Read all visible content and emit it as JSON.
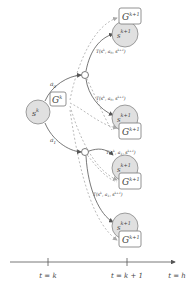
{
  "diagram": {
    "root": {
      "state_label": "s",
      "state_sup": "k",
      "value_label": "G",
      "value_sup": "k"
    },
    "actions": [
      {
        "label": "a",
        "sub": "0"
      },
      {
        "label": "a",
        "sub": "1"
      }
    ],
    "transitions": [
      {
        "label": "T(s^k, a_0, s_1^{k+1})",
        "text": "T(s",
        "sup": "k",
        "mid": ", a",
        "asub": "0",
        "end": ", s",
        "ssub": "1",
        "ssup": "k+1",
        "close": ")"
      },
      {
        "label": "T(s^k, a_0, s_2^{k+1})",
        "text": "T(s",
        "sup": "k",
        "mid": ", a",
        "asub": "0",
        "end": ", s",
        "ssub": "2",
        "ssup": "k+1",
        "close": ")"
      },
      {
        "label": "T(s^k, a_1, s_3^{k+1})",
        "text": "T(s",
        "sup": "k",
        "mid": ", a",
        "asub": "1",
        "end": ", s",
        "ssub": "3",
        "ssup": "k+1",
        "close": ")"
      },
      {
        "label": "T(s^k, a_1, s_4^{k+1})",
        "text": "T(s",
        "sup": "k",
        "mid": ", a",
        "asub": "1",
        "end": ", s",
        "ssub": "4",
        "ssup": "k+1",
        "close": ")"
      }
    ],
    "leaves": [
      {
        "state_label": "s",
        "state_sub": "1",
        "state_sup": "k+1",
        "value_label": "G",
        "value_sub": "1",
        "value_sup": "k+1"
      },
      {
        "state_label": "s",
        "state_sub": "2",
        "state_sup": "k+1",
        "value_label": "G",
        "value_sub": "1",
        "value_sup": "k+1"
      },
      {
        "state_label": "s",
        "state_sub": "3",
        "state_sup": "k+1",
        "value_label": "G",
        "value_sub": "1",
        "value_sup": "k+1"
      },
      {
        "state_label": "s",
        "state_sub": "4",
        "state_sup": "k+1",
        "value_label": "G",
        "value_sub": "1",
        "value_sup": "k+1"
      }
    ],
    "timeline": {
      "ticks": [
        {
          "label": "t = k"
        },
        {
          "label": "t = k + 1"
        },
        {
          "label": "t = h"
        }
      ]
    },
    "colors": {
      "line": "#555555",
      "dashed": "#aaaaaa",
      "node_fill": "#e0e0e0",
      "node_stroke": "#888888",
      "box_stroke": "#777777"
    }
  }
}
